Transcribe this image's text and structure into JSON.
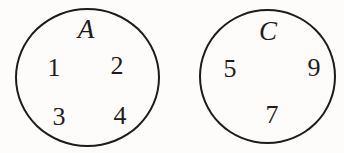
{
  "diagram": {
    "type": "set-diagram",
    "background_color": "#fdfcfb",
    "stroke_color": "#1c1c1c",
    "sets": [
      {
        "label": "A",
        "elements": [
          "1",
          "2",
          "3",
          "4"
        ]
      },
      {
        "label": "C",
        "elements": [
          "5",
          "9",
          "7"
        ]
      }
    ]
  }
}
